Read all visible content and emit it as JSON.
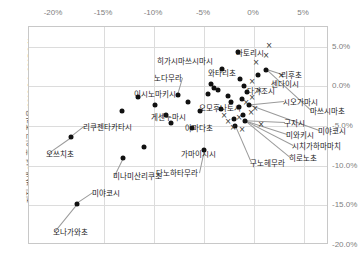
{
  "chart_data": {
    "type": "scatter",
    "title": "",
    "xlabel": "",
    "ylabel": "지진 발생 2년 후 인구 증가율(2012.3.1~2015.8.1)",
    "xlim": [
      -22.5,
      7.5
    ],
    "ylim": [
      -20.0,
      7.5
    ],
    "grid": true,
    "legend": "none",
    "xticks": [
      "-20%",
      "-15%",
      "-10%",
      "-5%",
      "0%",
      "5%"
    ],
    "xtick_values": [
      -20,
      -15,
      -10,
      -5,
      0,
      5
    ],
    "yticks": [
      "5.0%",
      "0.0%",
      "-5.0%",
      "-10.0%",
      "-15.0%",
      "-20.0%"
    ],
    "ytick_values": [
      5.0,
      0.0,
      -5.0,
      -10.0,
      -15.0,
      -20.0
    ],
    "series": [
      {
        "name": "원형 마커",
        "marker": "circle",
        "color": "#111111",
        "points": [
          {
            "label": "나토리시",
            "x": -1.6,
            "y": 4.3
          },
          {
            "label": "리후초",
            "x": 1.2,
            "y": 2.1
          },
          {
            "label": "센다이시",
            "x": 0.4,
            "y": 1.5
          },
          {
            "label": "와타리초",
            "x": -3.2,
            "y": 2.2
          },
          {
            "label": "히가시마쓰시마시",
            "x": -4.3,
            "y": 0.3
          },
          {
            "label": "노다무라",
            "x": -4.0,
            "y": -0.2
          },
          {
            "label": "이시노마키시",
            "x": -4.6,
            "y": -0.9
          },
          {
            "label": "오모후나토시",
            "x": -3.6,
            "y": -0.5
          },
          {
            "label": "다가조시",
            "x": -1.4,
            "y": 0.9
          },
          {
            "label": "게센누마시",
            "x": -6.6,
            "y": -2.0
          },
          {
            "label": "리쿠젠타카타시",
            "x": -13.2,
            "y": -3.1
          },
          {
            "label": "야마다초",
            "x": -8.8,
            "y": -3.6
          },
          {
            "label": "가마이시시",
            "x": -6.2,
            "y": -5.3
          },
          {
            "label": "오쓰치초",
            "x": -18.3,
            "y": -6.4
          },
          {
            "label": "미나미산리쿠초",
            "x": -11.0,
            "y": -7.6
          },
          {
            "label": "미야코시",
            "x": -13.1,
            "y": -9.0
          },
          {
            "label": "오나가와초",
            "x": -17.7,
            "y": -14.8
          },
          {
            "label": "다노하타무라",
            "x": -5.0,
            "y": -8.0
          },
          {
            "label": "구노헤무라",
            "x": -1.9,
            "y": -5.0
          },
          {
            "label": "시오가마시",
            "x": -1.0,
            "y": 0.1
          },
          {
            "label": "마쓰시마초",
            "x": -0.7,
            "y": -0.7
          },
          {
            "label": "구지시",
            "x": -1.2,
            "y": -1.6
          },
          {
            "label": "미야코시",
            "x": -0.5,
            "y": -2.4
          },
          {
            "label": "미와키시",
            "x": -1.5,
            "y": -2.6
          },
          {
            "label": "시치가하마마치",
            "x": -1.1,
            "y": -3.6
          },
          {
            "label": "히로노초",
            "x": -0.9,
            "y": -4.4
          },
          {
            "label": "미야코시2",
            "x": -2.6,
            "y": -1.2
          },
          {
            "label": "기타1",
            "x": -7.6,
            "y": -1.1
          },
          {
            "label": "기타2",
            "x": -9.9,
            "y": -2.3
          },
          {
            "label": "기타3",
            "x": -11.6,
            "y": -1.3
          },
          {
            "label": "기타4",
            "x": -5.4,
            "y": -3.1
          },
          {
            "label": "기타5",
            "x": -3.3,
            "y": -2.9
          },
          {
            "label": "기타6",
            "x": -2.3,
            "y": -1.9
          },
          {
            "label": "기타7",
            "x": -8.3,
            "y": -4.6
          },
          {
            "label": "기타8",
            "x": -2.0,
            "y": -4.1
          }
        ]
      },
      {
        "name": "X 마커",
        "marker": "x",
        "color": "#333333",
        "points": [
          {
            "x": 1.5,
            "y": 5.1
          },
          {
            "x": 1.2,
            "y": 3.9
          },
          {
            "x": 0.2,
            "y": 2.9
          },
          {
            "x": 2.7,
            "y": 1.3
          },
          {
            "x": -0.2,
            "y": 0.5
          },
          {
            "x": 0.5,
            "y": -0.6
          },
          {
            "x": -0.2,
            "y": -1.5
          },
          {
            "x": -0.8,
            "y": -2.1
          },
          {
            "x": 0.1,
            "y": -2.8
          },
          {
            "x": -0.3,
            "y": -3.4
          },
          {
            "x": -1.5,
            "y": -4.0
          },
          {
            "x": -2.6,
            "y": -4.5
          },
          {
            "x": -2.1,
            "y": -5.2
          },
          {
            "x": -1.2,
            "y": -5.5
          },
          {
            "x": 0.7,
            "y": -4.9
          },
          {
            "x": -3.0,
            "y": -3.7
          }
        ]
      }
    ],
    "callout_labels": [
      {
        "text": "나토리시",
        "side": "left",
        "x": 236,
        "y": 52
      },
      {
        "text": "리후초",
        "side": "left",
        "x": 281,
        "y": 74
      },
      {
        "text": "센다이시",
        "side": "left",
        "x": 271,
        "y": 83
      },
      {
        "text": "와타리초",
        "side": "right",
        "x": 236,
        "y": 72
      },
      {
        "text": "히가시마쓰시마시",
        "side": "right",
        "x": 213,
        "y": 60
      },
      {
        "text": "노다무라",
        "side": "right",
        "x": 182,
        "y": 77
      },
      {
        "text": "이시노마키시",
        "side": "right",
        "x": 176,
        "y": 93
      },
      {
        "text": "오모후나토시",
        "side": "right",
        "x": 241,
        "y": 107
      },
      {
        "text": "다가조시",
        "side": "left",
        "x": 247,
        "y": 90
      },
      {
        "text": "게센누마시",
        "side": "right",
        "x": 186,
        "y": 116
      },
      {
        "text": "리쿠젠타카타시",
        "side": "left",
        "x": 83,
        "y": 126
      },
      {
        "text": "야마다초",
        "side": "left",
        "x": 185,
        "y": 127
      },
      {
        "text": "가마이시시",
        "side": "right",
        "x": 216,
        "y": 153
      },
      {
        "text": "오쓰치초",
        "side": "left",
        "x": 46,
        "y": 153
      },
      {
        "text": "미나미산리쿠초",
        "side": "left",
        "x": 113,
        "y": 175
      },
      {
        "text": "미야코시",
        "side": "left",
        "x": 92,
        "y": 192
      },
      {
        "text": "오나가와초",
        "side": "left",
        "x": 53,
        "y": 231
      },
      {
        "text": "다노하타무라",
        "side": "right",
        "x": 198,
        "y": 172
      },
      {
        "text": "구노헤무라",
        "side": "left",
        "x": 250,
        "y": 162
      },
      {
        "text": "시오가마시",
        "side": "left",
        "x": 283,
        "y": 101
      },
      {
        "text": "마쓰시마초",
        "side": "left",
        "x": 310,
        "y": 110
      },
      {
        "text": "구지시",
        "side": "left",
        "x": 284,
        "y": 122
      },
      {
        "text": "미야코시",
        "side": "left",
        "x": 318,
        "y": 130
      },
      {
        "text": "미와키시",
        "side": "left",
        "x": 286,
        "y": 134
      },
      {
        "text": "시치가하마마치",
        "side": "left",
        "x": 292,
        "y": 145
      },
      {
        "text": "히로노초",
        "side": "left",
        "x": 289,
        "y": 157
      }
    ]
  }
}
